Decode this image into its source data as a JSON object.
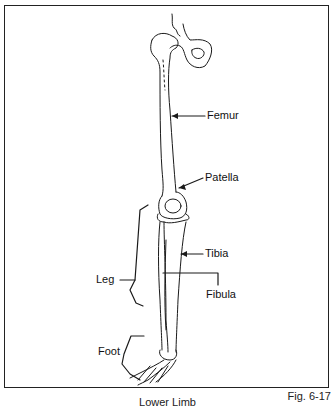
{
  "figure": {
    "number": "Fig. 6-17",
    "caption": "Lower Limb"
  },
  "labels": [
    {
      "id": "femur",
      "text": "Femur"
    },
    {
      "id": "patella",
      "text": "Patella"
    },
    {
      "id": "tibia",
      "text": "Tibia"
    },
    {
      "id": "leg",
      "text": "Leg"
    },
    {
      "id": "fibula",
      "text": "Fibula"
    },
    {
      "id": "foot",
      "text": "Foot"
    }
  ],
  "colors": {
    "line": "#1a1a1a",
    "background": "#ffffff"
  }
}
